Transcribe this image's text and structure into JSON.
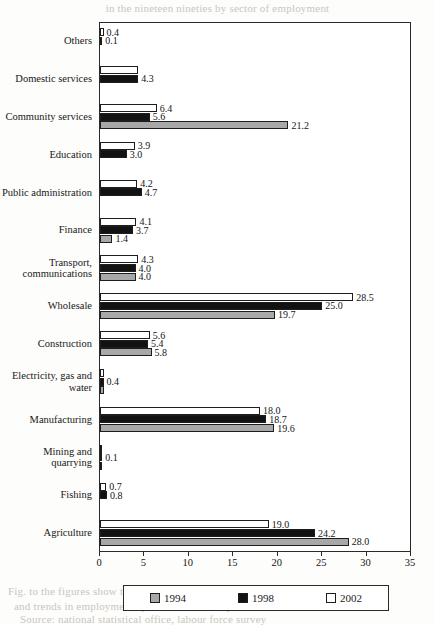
{
  "bleed_text": {
    "top": "in the nineteen nineties by sector of employment",
    "line1": "Fig. to the figures show the distribution of the labour force",
    "line2": "and trends in employment by economic activity over time",
    "line3": "Source: national statistical office, labour force survey"
  },
  "legend": {
    "position": "bottom",
    "items": [
      {
        "label": "1994",
        "color": "#a8a8a8",
        "swatch": "swatch-1994"
      },
      {
        "label": "1998",
        "color": "#121212",
        "swatch": "swatch-1998"
      },
      {
        "label": "2002",
        "color": "#ffffff",
        "swatch": "swatch-2002"
      }
    ]
  },
  "axis": {
    "ticks": [
      "0",
      "5",
      "10",
      "15",
      "20",
      "25",
      "30",
      "35"
    ]
  },
  "chart_data": {
    "type": "bar",
    "orientation": "horizontal",
    "title": "",
    "xlabel": "",
    "ylabel": "",
    "xlim": [
      0,
      35
    ],
    "xticks": [
      0,
      5,
      10,
      15,
      20,
      25,
      30,
      35
    ],
    "grid": false,
    "legend_position": "bottom",
    "categories": [
      "Others",
      "Domestic services",
      "Community services",
      "Education",
      "Public administration",
      "Finance",
      "Transport, communications",
      "Wholesale",
      "Construction",
      "Electricity, gas and water",
      "Manufacturing",
      "Mining and quarrying",
      "Fishing",
      "Agriculture"
    ],
    "series": [
      {
        "name": "1994",
        "color": "#a8a8a8",
        "values": [
          null,
          null,
          21.2,
          null,
          null,
          1.4,
          4.0,
          19.7,
          5.8,
          0.4,
          19.6,
          0.1,
          null,
          28.0
        ]
      },
      {
        "name": "1998",
        "color": "#121212",
        "values": [
          0.1,
          4.3,
          5.6,
          3.0,
          4.7,
          3.7,
          4.0,
          25.0,
          5.4,
          0.4,
          18.7,
          0.1,
          0.8,
          24.2
        ]
      },
      {
        "name": "2002",
        "color": "#ffffff",
        "values": [
          0.4,
          4.3,
          6.4,
          3.9,
          4.2,
          4.1,
          4.3,
          28.5,
          5.6,
          0.4,
          18.0,
          0.1,
          0.7,
          19.0
        ]
      }
    ],
    "value_labels": [
      {
        "category": "Others",
        "series": "2002",
        "text": "0.4"
      },
      {
        "category": "Others",
        "series": "1998",
        "text": "0.1"
      },
      {
        "category": "Domestic services",
        "series": "1998",
        "text": "4.3"
      },
      {
        "category": "Community services",
        "series": "2002",
        "text": "6.4"
      },
      {
        "category": "Community services",
        "series": "1998",
        "text": "5.6"
      },
      {
        "category": "Community services",
        "series": "1994",
        "text": "21.2"
      },
      {
        "category": "Education",
        "series": "2002",
        "text": "3.9"
      },
      {
        "category": "Education",
        "series": "1998",
        "text": "3.0"
      },
      {
        "category": "Public administration",
        "series": "2002",
        "text": "4.2"
      },
      {
        "category": "Public administration",
        "series": "1998",
        "text": "4.7"
      },
      {
        "category": "Finance",
        "series": "2002",
        "text": "4.1"
      },
      {
        "category": "Finance",
        "series": "1998",
        "text": "3.7"
      },
      {
        "category": "Finance",
        "series": "1994",
        "text": "1.4"
      },
      {
        "category": "Transport, communications",
        "series": "2002",
        "text": "4.3"
      },
      {
        "category": "Transport, communications",
        "series": "1998",
        "text": "4.0"
      },
      {
        "category": "Transport, communications",
        "series": "1994",
        "text": "4.0"
      },
      {
        "category": "Wholesale",
        "series": "2002",
        "text": "28.5"
      },
      {
        "category": "Wholesale",
        "series": "1998",
        "text": "25.0"
      },
      {
        "category": "Wholesale",
        "series": "1994",
        "text": "19.7"
      },
      {
        "category": "Construction",
        "series": "2002",
        "text": "5.6"
      },
      {
        "category": "Construction",
        "series": "1998",
        "text": "5.4"
      },
      {
        "category": "Construction",
        "series": "1994",
        "text": "5.8"
      },
      {
        "category": "Electricity, gas and water",
        "series": "1998",
        "text": "0.4"
      },
      {
        "category": "Manufacturing",
        "series": "2002",
        "text": "18.0"
      },
      {
        "category": "Manufacturing",
        "series": "1998",
        "text": "18.7"
      },
      {
        "category": "Manufacturing",
        "series": "1994",
        "text": "19.6"
      },
      {
        "category": "Mining and quarrying",
        "series": "1998",
        "text": "0.1"
      },
      {
        "category": "Fishing",
        "series": "2002",
        "text": "0.7"
      },
      {
        "category": "Fishing",
        "series": "1998",
        "text": "0.8"
      },
      {
        "category": "Agriculture",
        "series": "2002",
        "text": "19.0"
      },
      {
        "category": "Agriculture",
        "series": "1998",
        "text": "24.2"
      },
      {
        "category": "Agriculture",
        "series": "1994",
        "text": "28.0"
      }
    ]
  }
}
